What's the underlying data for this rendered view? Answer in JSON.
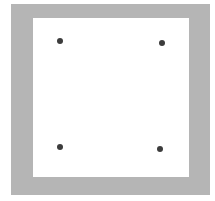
{
  "diagram": {
    "frame": {
      "color": "#b5b5b5",
      "x": 11,
      "y": 4,
      "w": 199,
      "h": 191
    },
    "inner": {
      "color": "#ffffff",
      "x": 33,
      "y": 18,
      "w": 156,
      "h": 159
    },
    "dots": [
      {
        "name": "top-left",
        "x": 60,
        "y": 41
      },
      {
        "name": "top-right",
        "x": 162,
        "y": 43
      },
      {
        "name": "bottom-left",
        "x": 60,
        "y": 147
      },
      {
        "name": "bottom-right",
        "x": 160,
        "y": 149
      }
    ],
    "dot_color": "#3c3c3c"
  }
}
